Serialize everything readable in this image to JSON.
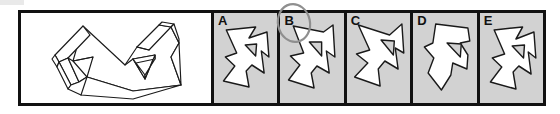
{
  "test_item": {
    "type": "mental-rotation-multiple-choice",
    "reference_panel": {
      "name": "reference-figure",
      "label": "",
      "background_color": "#ffffff",
      "description": "3D wireframe block figure shown in isometric projection"
    },
    "options": [
      {
        "label": "A",
        "background_color": "#d2d2d2",
        "selected": false
      },
      {
        "label": "B",
        "background_color": "#d2d2d2",
        "selected": true
      },
      {
        "label": "C",
        "background_color": "#d2d2d2",
        "selected": false
      },
      {
        "label": "D",
        "background_color": "#d2d2d2",
        "selected": false
      },
      {
        "label": "E",
        "background_color": "#d2d2d2",
        "selected": false
      }
    ],
    "annotation": {
      "name": "selection-circle",
      "target_label": "B",
      "shape": "hand-drawn-ellipse",
      "color": "#8f8f8f"
    },
    "colors": {
      "border": "#111111",
      "panel_background": "#d2d2d2",
      "reference_background": "#ffffff",
      "shape_fill": "#ffffff",
      "shape_stroke": "#111111",
      "annotation": "#8f8f8f",
      "page_background": "#ffffff"
    }
  }
}
